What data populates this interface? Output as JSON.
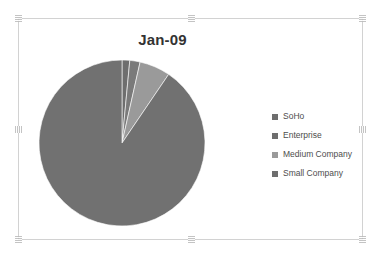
{
  "chart": {
    "title": "Jan-09",
    "frame_border_color": "#d2d2d2",
    "background_color": "#ffffff",
    "title_color": "#333333",
    "selected": true
  },
  "legend": {
    "position": "right",
    "items": [
      {
        "label": "SoHo",
        "color": "#6e6e6e"
      },
      {
        "label": "Enterprise",
        "color": "#6e6e6e"
      },
      {
        "label": "Medium Company",
        "color": "#9a9a9a"
      },
      {
        "label": "Small Company",
        "color": "#6e6e6e"
      }
    ]
  },
  "handles": {
    "top_left": "resize-handle-top-left",
    "top_center": "resize-handle-top-center",
    "top_right": "resize-handle-top-right",
    "middle_left": "resize-handle-middle-left",
    "middle_right": "resize-handle-middle-right",
    "bottom_left": "resize-handle-bottom-left",
    "bottom_center": "resize-handle-bottom-center",
    "bottom_right": "resize-handle-bottom-right"
  },
  "chart_data": {
    "type": "pie",
    "title": "Jan-09",
    "xlabel": "",
    "ylabel": "",
    "grid": false,
    "legend_position": "right",
    "start_angle_deg": 0,
    "direction": "clockwise",
    "categories": [
      "SoHo",
      "Enterprise",
      "Medium Company",
      "Small Company"
    ],
    "values": [
      1.5,
      2.0,
      6.0,
      90.5
    ],
    "value_unit": "percent",
    "colors": [
      "#6e6e6e",
      "#7a7a7a",
      "#9a9a9a",
      "#717171"
    ],
    "slices": [
      {
        "label": "SoHo",
        "value": 1.5,
        "color": "#6e6e6e"
      },
      {
        "label": "Enterprise",
        "value": 2.0,
        "color": "#7a7a7a"
      },
      {
        "label": "Medium Company",
        "value": 6.0,
        "color": "#9a9a9a"
      },
      {
        "label": "Small Company",
        "value": 90.5,
        "color": "#717171"
      }
    ]
  }
}
